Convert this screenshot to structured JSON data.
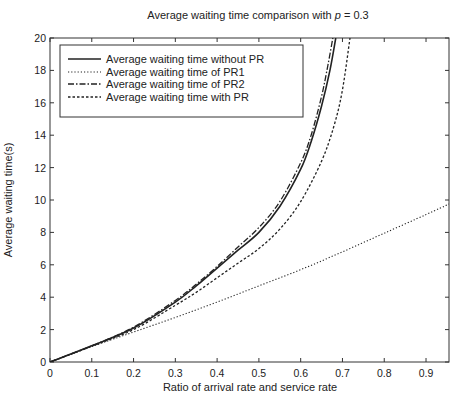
{
  "chart_data": {
    "type": "line",
    "title": "Average waiting time comparison with p = 0.3",
    "title_prefix": "Average waiting time comparison with ",
    "title_var": "p",
    "title_suffix": " = 0.3",
    "xlabel": "Ratio of arrival rate and service rate",
    "ylabel": "Average waiting time(s)",
    "xlim": [
      0,
      0.955
    ],
    "ylim": [
      0,
      20
    ],
    "xticks": [
      0,
      0.1,
      0.2,
      0.3,
      0.4,
      0.5,
      0.6,
      0.7,
      0.8,
      0.9
    ],
    "xtick_labels": [
      "0",
      "0.1",
      "0.2",
      "0.3",
      "0.4",
      "0.5",
      "0.6",
      "0.7",
      "0.8",
      "0.9"
    ],
    "yticks": [
      0,
      2,
      4,
      6,
      8,
      10,
      12,
      14,
      16,
      18,
      20
    ],
    "ytick_labels": [
      "0",
      "2",
      "4",
      "6",
      "8",
      "10",
      "12",
      "14",
      "16",
      "18",
      "20"
    ],
    "grid": false,
    "legend_position": "upper left",
    "series": [
      {
        "name": "Average waiting time without PR",
        "style": "solid",
        "x": [
          0,
          0.1,
          0.2,
          0.3,
          0.35,
          0.4,
          0.45,
          0.5,
          0.55,
          0.6,
          0.625,
          0.65,
          0.67,
          0.684
        ],
        "y": [
          0,
          1.0,
          2.1,
          3.7,
          4.7,
          5.8,
          6.9,
          8.0,
          9.6,
          11.9,
          13.6,
          15.8,
          18.0,
          20.0
        ]
      },
      {
        "name": "Average waiting time of PR1",
        "style": "dotted",
        "x": [
          0,
          0.1,
          0.2,
          0.3,
          0.4,
          0.5,
          0.6,
          0.7,
          0.8,
          0.9,
          0.955
        ],
        "y": [
          0,
          0.95,
          1.85,
          2.75,
          3.7,
          4.7,
          5.7,
          6.8,
          7.95,
          9.1,
          9.75
        ]
      },
      {
        "name": "Average waiting time of PR2",
        "style": "dashdot",
        "x": [
          0,
          0.1,
          0.2,
          0.3,
          0.35,
          0.4,
          0.45,
          0.5,
          0.55,
          0.6,
          0.625,
          0.65,
          0.665,
          0.677
        ],
        "y": [
          0,
          1.0,
          2.15,
          3.8,
          4.8,
          5.9,
          7.1,
          8.3,
          9.9,
          12.3,
          14.0,
          16.4,
          18.3,
          20.0
        ]
      },
      {
        "name": "Average waiting time with PR",
        "style": "dashed",
        "x": [
          0,
          0.1,
          0.2,
          0.3,
          0.35,
          0.4,
          0.45,
          0.5,
          0.55,
          0.6,
          0.65,
          0.68,
          0.7,
          0.718
        ],
        "y": [
          0,
          0.98,
          2.0,
          3.5,
          4.3,
          5.2,
          6.1,
          7.0,
          8.2,
          9.9,
          12.4,
          14.6,
          16.8,
          20.0
        ]
      }
    ]
  }
}
